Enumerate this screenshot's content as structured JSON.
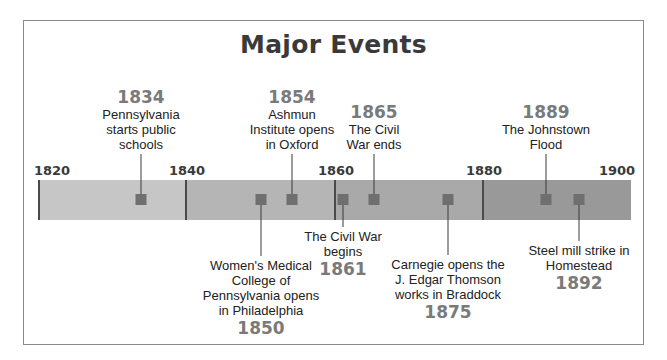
{
  "title": "Major Events",
  "timeline": {
    "start_year": 1820,
    "end_year": 1900,
    "ticks": [
      {
        "label": "1820",
        "x": 38
      },
      {
        "label": "1840",
        "x": 186
      },
      {
        "label": "1860",
        "x": 335
      },
      {
        "label": "1880",
        "x": 483
      },
      {
        "label": "1900",
        "x": 631
      }
    ],
    "segments": [
      {
        "from": "1820",
        "to": "1840",
        "color": "#c6c6c6"
      },
      {
        "from": "1840",
        "to": "1860",
        "color": "#b5b5b5"
      },
      {
        "from": "1860",
        "to": "1880",
        "color": "#a9a9a9"
      },
      {
        "from": "1880",
        "to": "1900",
        "color": "#999999"
      }
    ]
  },
  "events_above": [
    {
      "year": "1834",
      "text": [
        "Pennsylvania",
        "starts public",
        "schools"
      ],
      "x": 141
    },
    {
      "year": "1854",
      "text": [
        "Ashmun",
        "Institute opens",
        "in Oxford"
      ],
      "x": 292
    },
    {
      "year": "1865",
      "text": [
        "The Civil",
        "War ends"
      ],
      "x": 374
    },
    {
      "year": "1889",
      "text": [
        "The Johnstown",
        "Flood"
      ],
      "x": 546
    }
  ],
  "events_below": [
    {
      "year": "1850",
      "text": [
        "Women's Medical",
        "College of",
        "Pennsylvania opens",
        "in Philadelphia"
      ],
      "x": 261
    },
    {
      "year": "1861",
      "text": [
        "The Civil War",
        "begins"
      ],
      "x": 343
    },
    {
      "year": "1875",
      "text": [
        "Carnegie opens the",
        "J. Edgar Thomson",
        "works in Braddock"
      ],
      "x": 448
    },
    {
      "year": "1892",
      "text": [
        "Steel mill strike in",
        "Homestead"
      ],
      "x": 579
    }
  ]
}
